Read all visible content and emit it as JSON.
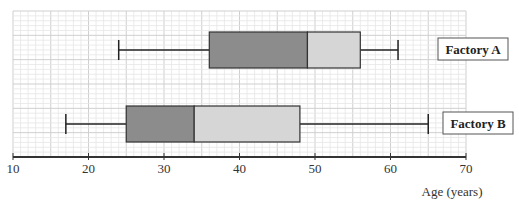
{
  "chart_data": {
    "type": "boxplot",
    "title": "",
    "xlabel": "Age (years)",
    "ylabel": "",
    "xlim": [
      10,
      70
    ],
    "x_ticks": [
      10,
      20,
      30,
      40,
      50,
      60,
      70
    ],
    "x_tick_labels": [
      "10",
      "20",
      "30",
      "40",
      "50",
      "60",
      "70"
    ],
    "grid": true,
    "minor_grid_step": 1,
    "major_grid_step": 5,
    "series": [
      {
        "name": "Factory A",
        "min": 24,
        "q1": 36,
        "median": 49,
        "q3": 56,
        "max": 61
      },
      {
        "name": "Factory B",
        "min": 17,
        "q1": 25,
        "median": 34,
        "q3": 48,
        "max": 65
      }
    ],
    "colors": {
      "lower_box": "#8c8c8c",
      "upper_box": "#d6d6d6",
      "box_stroke": "#333333",
      "whisker": "#222222",
      "grid_minor": "#e6e6e6",
      "grid_major": "#cfcfcf",
      "axis": "#333333"
    }
  }
}
